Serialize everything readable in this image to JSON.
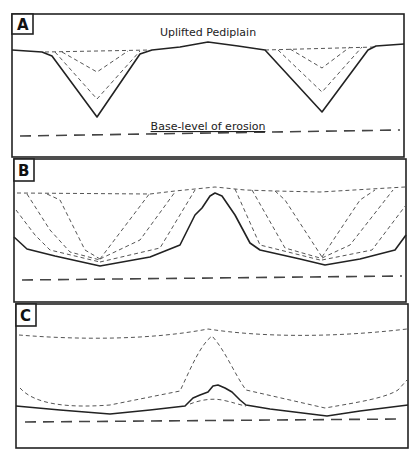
{
  "figure": {
    "type": "geomorphology cross-section diagram",
    "panels": [
      {
        "id": "A",
        "label": "A",
        "annotations": {
          "top": "Uplifted Pediplain",
          "base": "Base-level of erosion"
        }
      },
      {
        "id": "B",
        "label": "B"
      },
      {
        "id": "C",
        "label": "C"
      }
    ],
    "legend_styles": {
      "current_surface": "solid line",
      "former_surfaces": "short dashed lines",
      "base_level": "long dashed line"
    },
    "colors": {
      "line": "#222222",
      "dashed": "#555555",
      "background": "#ffffff"
    }
  }
}
